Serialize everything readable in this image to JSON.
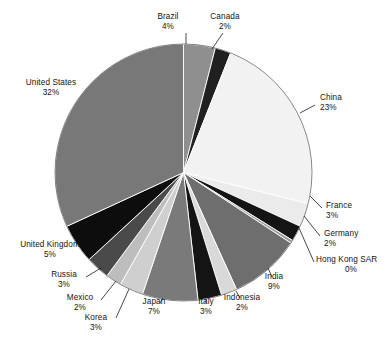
{
  "chart_data": {
    "type": "pie",
    "title": "",
    "subtitle": "",
    "xlabel": "",
    "ylabel": "",
    "legend_position": "labels-around-perimeter",
    "grid": false,
    "units": "percent",
    "start_angle_deg": 0,
    "direction": "clockwise",
    "categories": [
      "Brazil",
      "Canada",
      "China",
      "France",
      "Germany",
      "Hong Kong SAR",
      "India",
      "Indonesia",
      "Italy",
      "Japan",
      "Korea",
      "Mexico",
      "Russia",
      "United Kingdom",
      "United States"
    ],
    "values": [
      4,
      2,
      23,
      3,
      2,
      0,
      9,
      2,
      3,
      7,
      3,
      2,
      3,
      5,
      32
    ],
    "labels": [
      "4%",
      "2%",
      "23%",
      "3%",
      "2%",
      "0%",
      "9%",
      "2%",
      "3%",
      "7%",
      "3%",
      "2%",
      "3%",
      "5%",
      "32%"
    ],
    "colors": [
      "#8f8f8f",
      "#202020",
      "#f2f2f2",
      "#ebebeb",
      "#141414",
      "#9a9a9a",
      "#6e6e6e",
      "#d9d9d9",
      "#141414",
      "#7a7a7a",
      "#cfcfcf",
      "#bdbdbd",
      "#4a4a4a",
      "#0d0d0d",
      "#787878"
    ],
    "slices": [
      {
        "name": "Brazil",
        "value": 4,
        "label": "4%",
        "color": "#8f8f8f",
        "sweep_deg": 14.4
      },
      {
        "name": "Canada",
        "value": 2,
        "label": "2%",
        "color": "#202020",
        "sweep_deg": 7.2
      },
      {
        "name": "China",
        "value": 23,
        "label": "23%",
        "color": "#f2f2f2",
        "sweep_deg": 82.8
      },
      {
        "name": "France",
        "value": 3,
        "label": "3%",
        "color": "#ebebeb",
        "sweep_deg": 10.8
      },
      {
        "name": "Germany",
        "value": 2,
        "label": "2%",
        "color": "#141414",
        "sweep_deg": 7.2
      },
      {
        "name": "Hong Kong SAR",
        "value": 0,
        "label": "0%",
        "color": "#9a9a9a",
        "sweep_deg": 1.4
      },
      {
        "name": "India",
        "value": 9,
        "label": "9%",
        "color": "#6e6e6e",
        "sweep_deg": 32.4
      },
      {
        "name": "Indonesia",
        "value": 2,
        "label": "2%",
        "color": "#d9d9d9",
        "sweep_deg": 7.2
      },
      {
        "name": "Italy",
        "value": 3,
        "label": "3%",
        "color": "#141414",
        "sweep_deg": 10.8
      },
      {
        "name": "Japan",
        "value": 7,
        "label": "7%",
        "color": "#7a7a7a",
        "sweep_deg": 25.2
      },
      {
        "name": "Korea",
        "value": 3,
        "label": "3%",
        "color": "#cfcfcf",
        "sweep_deg": 10.8
      },
      {
        "name": "Mexico",
        "value": 2,
        "label": "2%",
        "color": "#bdbdbd",
        "sweep_deg": 7.2
      },
      {
        "name": "Russia",
        "value": 3,
        "label": "3%",
        "color": "#4a4a4a",
        "sweep_deg": 10.8
      },
      {
        "name": "United Kingdom",
        "value": 5,
        "label": "5%",
        "color": "#0d0d0d",
        "sweep_deg": 18.0
      },
      {
        "name": "United States",
        "value": 32,
        "label": "32%",
        "color": "#787878",
        "sweep_deg": 115.2
      }
    ]
  },
  "labels": {
    "brazil": {
      "name": "Brazil",
      "pct": "4%"
    },
    "canada": {
      "name": "Canada",
      "pct": "2%"
    },
    "china": {
      "name": "China",
      "pct": "23%"
    },
    "france": {
      "name": "France",
      "pct": "3%"
    },
    "germany": {
      "name": "Germany",
      "pct": "2%"
    },
    "hong_kong": {
      "name": "Hong Kong SAR",
      "pct": "0%"
    },
    "india": {
      "name": "India",
      "pct": "9%"
    },
    "indonesia": {
      "name": "Indonesia",
      "pct": "2%"
    },
    "italy": {
      "name": "Italy",
      "pct": "3%"
    },
    "japan": {
      "name": "Japan",
      "pct": "7%"
    },
    "korea": {
      "name": "Korea",
      "pct": "3%"
    },
    "mexico": {
      "name": "Mexico",
      "pct": "2%"
    },
    "russia": {
      "name": "Russia",
      "pct": "3%"
    },
    "united_kingdom": {
      "name": "United Kingdom",
      "pct": "5%"
    },
    "united_states": {
      "name": "United States",
      "pct": "32%"
    }
  }
}
